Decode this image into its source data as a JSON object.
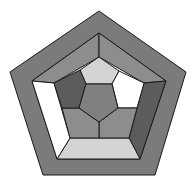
{
  "diagram": {
    "title": "",
    "colors": {
      "outer_border": "#7b7b7b",
      "mid_grey": "#8d8d8d",
      "dark_grey": "#5c5c5c",
      "light_grey": "#d3d3d3",
      "white": "#ffffff",
      "center": "#808080",
      "stroke": "#1a1a1a"
    },
    "shapes": [
      {
        "name": "outer-border-ring",
        "fill": "outer_border"
      },
      {
        "name": "middle-ring-top-left",
        "fill": "mid_grey"
      },
      {
        "name": "middle-ring-top-right",
        "fill": "mid_grey"
      },
      {
        "name": "middle-ring-right",
        "fill": "dark_grey"
      },
      {
        "name": "middle-ring-bottom",
        "fill": "light_grey"
      },
      {
        "name": "middle-ring-left",
        "fill": "white"
      },
      {
        "name": "inner-ring-top",
        "fill": "light_grey"
      },
      {
        "name": "inner-ring-right",
        "fill": "white"
      },
      {
        "name": "inner-ring-bottom-right",
        "fill": "mid_grey"
      },
      {
        "name": "inner-ring-bottom-left",
        "fill": "mid_grey"
      },
      {
        "name": "inner-ring-left",
        "fill": "dark_grey"
      },
      {
        "name": "center-pentagon",
        "fill": "center"
      }
    ]
  }
}
